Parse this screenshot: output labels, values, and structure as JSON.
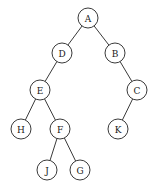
{
  "figure": {
    "kind": "binary-tree-diagram",
    "width": 156,
    "height": 192,
    "background_color": "#ffffff",
    "stroke_color": "#3a3a3a",
    "label_color": "#1a1a1a",
    "node_radius": 10
  },
  "chart_data": {
    "type": "diagram",
    "title": "",
    "nodes": [
      {
        "id": "A",
        "label": "A",
        "x": 88,
        "y": 18,
        "depth": 0
      },
      {
        "id": "D",
        "label": "D",
        "x": 62,
        "y": 53,
        "depth": 1
      },
      {
        "id": "B",
        "label": "B",
        "x": 115,
        "y": 53,
        "depth": 1
      },
      {
        "id": "E",
        "label": "E",
        "x": 40,
        "y": 90,
        "depth": 2
      },
      {
        "id": "C",
        "label": "C",
        "x": 137,
        "y": 90,
        "depth": 2
      },
      {
        "id": "H",
        "label": "H",
        "x": 21,
        "y": 129,
        "depth": 3
      },
      {
        "id": "F",
        "label": "F",
        "x": 60,
        "y": 129,
        "depth": 3
      },
      {
        "id": "K",
        "label": "K",
        "x": 118,
        "y": 129,
        "depth": 3
      },
      {
        "id": "J",
        "label": "J",
        "x": 47,
        "y": 170,
        "depth": 4
      },
      {
        "id": "G",
        "label": "G",
        "x": 80,
        "y": 170,
        "depth": 4
      }
    ],
    "edges": [
      {
        "from": "A",
        "to": "D",
        "side": "left"
      },
      {
        "from": "A",
        "to": "B",
        "side": "right"
      },
      {
        "from": "D",
        "to": "E",
        "side": "left"
      },
      {
        "from": "E",
        "to": "H",
        "side": "left"
      },
      {
        "from": "E",
        "to": "F",
        "side": "right"
      },
      {
        "from": "F",
        "to": "J",
        "side": "left"
      },
      {
        "from": "F",
        "to": "G",
        "side": "right"
      },
      {
        "from": "B",
        "to": "C",
        "side": "right"
      },
      {
        "from": "C",
        "to": "K",
        "side": "left"
      }
    ],
    "root": "A"
  }
}
